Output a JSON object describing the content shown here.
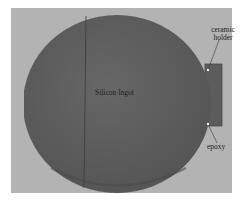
{
  "image": {
    "description": "Photograph of a silicon ingot disc attached to a ceramic holder with epoxy",
    "background_color": "#b3b3b3",
    "ingot_color": "#606060",
    "holder_color": "#5a5a5a"
  },
  "labels": {
    "ingot": "Silicon Ingot",
    "ceramic_line1": "ceramic",
    "ceramic_line2": "holder",
    "epoxy": "epoxy"
  }
}
